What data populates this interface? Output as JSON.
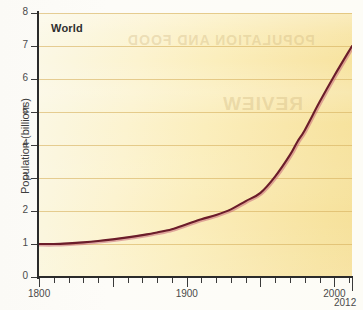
{
  "figure": {
    "series_label": "World",
    "ghost_text_1": "POPULATION AND FOOD",
    "ghost_text_2": "REVIEW"
  },
  "colors": {
    "line": "#6b1d2a",
    "line_highlight": "#c9697a",
    "gridline": "#d6b260",
    "axis": "#2b2b2b",
    "plot_background_left": "#fbf8e6",
    "plot_background_right": "#f6e09a",
    "label_text": "#4a4a4a"
  },
  "chart_data": {
    "type": "line",
    "title": "",
    "xlabel": "",
    "ylabel": "Population (billions)",
    "xlim": [
      1800,
      2012
    ],
    "ylim": [
      0,
      8
    ],
    "grid": true,
    "legend_position": "inside-top-left",
    "x_ticks_major": [
      1800,
      1900,
      2000
    ],
    "x_tick_labels": [
      "1800",
      "1900",
      "2000"
    ],
    "x_end_label": "2012",
    "x_tick_interval_minor": 10,
    "x_tick_interval_major": 50,
    "y_ticks": [
      0,
      1,
      2,
      3,
      4,
      5,
      6,
      7,
      8
    ],
    "y_tick_labels": [
      "0",
      "1",
      "2",
      "3",
      "4",
      "5",
      "6",
      "7",
      "8"
    ],
    "series": [
      {
        "name": "World",
        "x": [
          1800,
          1810,
          1820,
          1830,
          1840,
          1850,
          1860,
          1870,
          1880,
          1890,
          1900,
          1910,
          1920,
          1930,
          1940,
          1950,
          1960,
          1970,
          1975,
          1980,
          1990,
          2000,
          2012
        ],
        "values": [
          1.0,
          1.0,
          1.02,
          1.05,
          1.09,
          1.14,
          1.2,
          1.27,
          1.35,
          1.45,
          1.6,
          1.75,
          1.88,
          2.05,
          2.3,
          2.55,
          3.05,
          3.7,
          4.1,
          4.45,
          5.3,
          6.1,
          7.0
        ]
      }
    ]
  }
}
